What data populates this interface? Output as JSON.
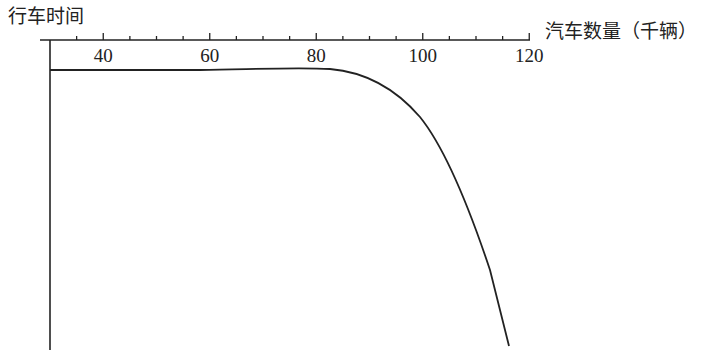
{
  "chart_data": {
    "type": "line",
    "title": "",
    "ylabel": "行车时间",
    "xlabel": "汽车数量（千辆）",
    "x_ticks": [
      40,
      60,
      80,
      100,
      120
    ],
    "x_minor_step": 5,
    "xlim": [
      30,
      120
    ],
    "y_ticks": [],
    "grid": false,
    "legend": null,
    "annotations": [],
    "series": [
      {
        "name": "行车时间",
        "x": [
          30,
          40,
          50,
          60,
          70,
          80,
          85,
          90,
          95,
          100,
          103,
          106,
          110,
          113,
          115.5
        ],
        "y_pixel_from_axis": [
          29,
          29,
          29,
          29,
          28.5,
          29,
          32,
          40,
          52,
          68,
          85,
          108,
          160,
          215,
          305
        ],
        "description": "Travel time stays nearly constant (flat) from 30k to ~80k cars, then bends and rises steeply; curve is drawn with time increasing downward from the top x-axis."
      }
    ]
  }
}
